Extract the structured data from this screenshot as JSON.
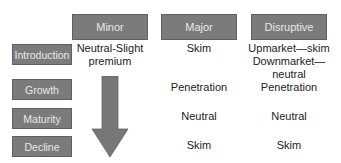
{
  "columns": [
    {
      "label": "Minor"
    },
    {
      "label": "Major"
    },
    {
      "label": "Disruptive"
    }
  ],
  "rows": [
    {
      "label": "Introduction"
    },
    {
      "label": "Growth"
    },
    {
      "label": "Maturity"
    },
    {
      "label": "Decline"
    }
  ],
  "cells": {
    "intro_minor_l1": "Neutral-Slight",
    "intro_minor_l2": "premium",
    "intro_major": "Skim",
    "intro_disruptive_l1": "Upmarket—skim",
    "intro_disruptive_l2": "Downmarket—neutral",
    "growth_major": "Penetration",
    "growth_disruptive": "Penetration",
    "maturity_major": "Neutral",
    "maturity_disruptive": "Neutral",
    "decline_major": "Skim",
    "decline_disruptive": "Skim"
  },
  "colors": {
    "box_fill": "#7b7b7b",
    "box_text": "#e8e8e8",
    "arrow": "#777777",
    "cell_text": "#222222"
  }
}
